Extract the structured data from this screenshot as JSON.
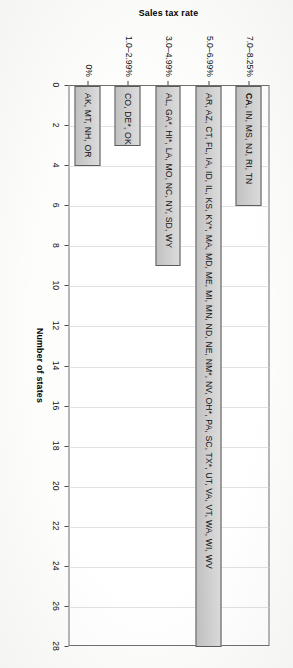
{
  "chart_data": {
    "type": "bar",
    "orientation": "horizontal",
    "title": "",
    "xlabel": "Number of states",
    "ylabel": "Sales tax rate",
    "xlim": [
      0,
      28
    ],
    "xticks": [
      0,
      2,
      4,
      6,
      8,
      10,
      12,
      14,
      16,
      18,
      20,
      22,
      24,
      26,
      28
    ],
    "xtick_labels": [
      "0",
      "2",
      "4",
      "6",
      "8",
      "10",
      "12",
      "14",
      "16",
      "18",
      "20",
      "22",
      "24",
      "26",
      "28"
    ],
    "grid": true,
    "legend": null,
    "categories": [
      "7.0–8.25%",
      "5.0–6.99%",
      "3.0–4.99%",
      "1.0–2.99%",
      "0%"
    ],
    "values": [
      6,
      28,
      9,
      3,
      4
    ],
    "annotations": [
      "CA, IN, MS, NJ, RI, TN",
      "AR, AZ, CT, FL, IA, ID, IL, KS, KY*, MA, MD, ME, MI, MN, ND, NE, NM*, NV, OH*, PA, SC, TX*, UT, VA, VT, WA, WI, WV",
      "AL, GA*, HI*, LA, MO, NC, NY, SD, WY",
      "CO, DE*, OK",
      "AK, MT, NH, OR"
    ],
    "bars": [
      {
        "category": "7.0–8.25%",
        "value": 6,
        "label_bold_prefix": "CA",
        "label_rest": ", IN, MS, NJ, RI, TN"
      },
      {
        "category": "5.0–6.99%",
        "value": 28,
        "label_bold_prefix": "",
        "label_rest": "AR, AZ, CT, FL, IA, ID, IL, KS, KY*, MA, MD, ME, MI, MN, ND, NE, NM*, NV, OH*, PA, SC, TX*, UT, VA, VT, WA, WI, WV"
      },
      {
        "category": "3.0–4.99%",
        "value": 9,
        "label_bold_prefix": "",
        "label_rest": "AL, GA*, HI*, LA, MO, NC, NY, SD, WY"
      },
      {
        "category": "1.0–2.99%",
        "value": 3,
        "label_bold_prefix": "",
        "label_rest": "CO, DE*, OK"
      },
      {
        "category": "0%",
        "value": 4,
        "label_bold_prefix": "",
        "label_rest": "AK, MT, NH, OR"
      }
    ],
    "colors": {
      "bar_fill": "#c9c9c9",
      "bar_stroke": "#5c5c5c",
      "grid": "#e2e2e2",
      "axis": "#4a4a4a",
      "text": "#101010",
      "background": "#ffffff"
    }
  }
}
